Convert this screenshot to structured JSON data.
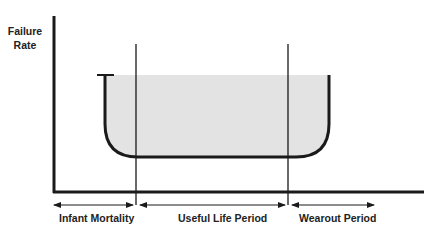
{
  "diagram": {
    "y_axis_label": "Failure Rate",
    "y_axis_label_lines": [
      "Failure",
      "Rate"
    ],
    "periods": [
      {
        "label": "Infant Mortality"
      },
      {
        "label": "Useful Life Period"
      },
      {
        "label": "Wearout Period"
      }
    ],
    "colors": {
      "line": "#1a1a1a",
      "fill": "#e3e3e3",
      "background": "#ffffff"
    }
  }
}
